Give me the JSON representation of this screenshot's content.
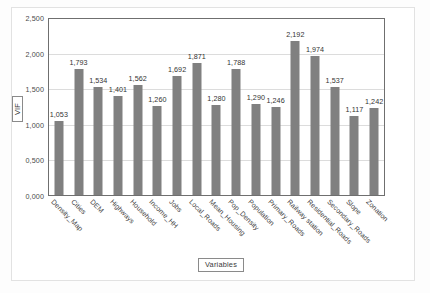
{
  "chart_data": {
    "type": "bar",
    "title": "",
    "xlabel": "Variables",
    "ylabel": "VIF",
    "ylim": [
      0,
      2.5
    ],
    "grid": true,
    "legend": "none",
    "ytick_labels": [
      "2,500",
      "2,000",
      "1,500",
      "1,000",
      "0,500",
      "0,000"
    ],
    "ytick_values": [
      2.5,
      2.0,
      1.5,
      1.0,
      0.5,
      0.0
    ],
    "categories": [
      "Density_Map",
      "Cities",
      "DEM",
      "Highways",
      "Household",
      "Income_HH",
      "Jobs",
      "Local_Roads",
      "Mean_Housing",
      "Pop_Density",
      "Population",
      "Primary_Roads",
      "Railway station",
      "Residential_Roads",
      "Secondary_Roads",
      "Slope",
      "Zonation"
    ],
    "values": [
      1.053,
      1.793,
      1.534,
      1.401,
      1.562,
      1.26,
      1.692,
      1.871,
      1.28,
      1.788,
      1.29,
      1.246,
      2.192,
      1.974,
      1.537,
      1.117,
      1.242
    ],
    "data_labels": [
      "1,053",
      "1,793",
      "1,534",
      "1,401",
      "1,562",
      "1,260",
      "1,692",
      "1,871",
      "1,280",
      "1,788",
      "1,290",
      "1,246",
      "2,192",
      "1,974",
      "1,537",
      "1,117",
      "1,242"
    ],
    "bar_color": "#808080",
    "grid_color": "#dcdcdc",
    "axis_color": "#6f6f6f"
  }
}
